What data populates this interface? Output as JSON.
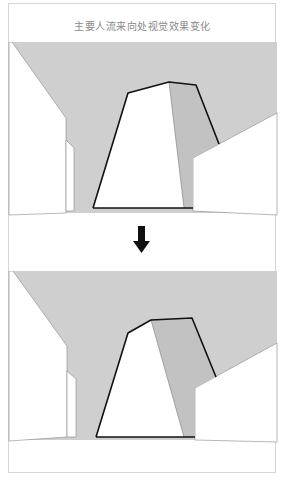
{
  "figure": {
    "title": "主要人流来向处视觉效果变化",
    "arrow_icon": "down-arrow",
    "colors": {
      "sky": "#cfcfcf",
      "shadow_face": "#c2c2c2",
      "building_fill": "#ffffff",
      "outline": "#111111",
      "frame": "#d6d6d6"
    },
    "panels": [
      {
        "name": "before",
        "description": "Street view with tall building at center, original massing"
      },
      {
        "name": "after",
        "description": "Street view with modified building massing, stepped top"
      }
    ]
  }
}
